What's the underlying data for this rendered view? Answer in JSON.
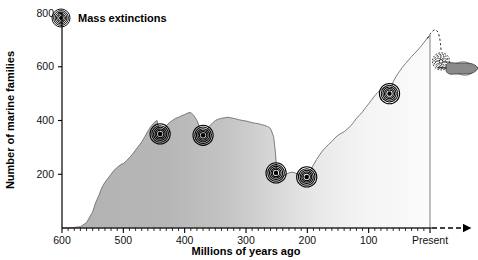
{
  "chart_data": {
    "type": "area",
    "title": "",
    "xlabel": "Millions of years ago",
    "ylabel": "Number of marine families",
    "xlim": [
      600,
      0
    ],
    "ylim": [
      0,
      800
    ],
    "x_ticks": [
      600,
      500,
      400,
      300,
      200,
      100,
      0
    ],
    "x_tick_labels": [
      "600",
      "500",
      "400",
      "300",
      "200",
      "100",
      "Present"
    ],
    "x_minor_tick_step": 10,
    "y_ticks": [
      200,
      400,
      600,
      800
    ],
    "y_tick_labels": [
      "200",
      "400",
      "600",
      "800"
    ],
    "grid": false,
    "legend_position": "top-left",
    "axis_direction_note": "time runs from 600 Mya at left to Present at right",
    "future_arrow": true,
    "series": [
      {
        "name": "Number of marine families",
        "fill": "gradient-gray-to-white",
        "x": [
          600,
          590,
          580,
          570,
          560,
          550,
          545,
          540,
          535,
          530,
          525,
          520,
          515,
          510,
          505,
          500,
          495,
          490,
          485,
          480,
          475,
          470,
          465,
          460,
          455,
          450,
          445,
          440,
          435,
          430,
          425,
          420,
          415,
          410,
          405,
          400,
          395,
          390,
          385,
          380,
          375,
          370,
          365,
          360,
          355,
          350,
          345,
          340,
          335,
          330,
          325,
          320,
          315,
          310,
          305,
          300,
          295,
          290,
          285,
          280,
          275,
          270,
          265,
          260,
          255,
          252,
          250,
          248,
          245,
          240,
          235,
          230,
          225,
          220,
          215,
          210,
          205,
          201,
          198,
          195,
          190,
          185,
          180,
          175,
          170,
          165,
          160,
          155,
          150,
          145,
          140,
          135,
          130,
          125,
          120,
          115,
          110,
          105,
          100,
          95,
          90,
          85,
          80,
          75,
          70,
          66,
          63,
          60,
          55,
          50,
          45,
          40,
          35,
          30,
          25,
          20,
          15,
          10,
          5,
          0
        ],
        "y": [
          0,
          0,
          2,
          5,
          20,
          60,
          95,
          120,
          150,
          170,
          185,
          200,
          215,
          225,
          235,
          240,
          250,
          262,
          275,
          290,
          305,
          320,
          340,
          360,
          378,
          392,
          400,
          350,
          365,
          380,
          392,
          400,
          408,
          412,
          418,
          422,
          428,
          430,
          418,
          400,
          370,
          345,
          360,
          378,
          390,
          400,
          405,
          408,
          410,
          412,
          410,
          408,
          405,
          402,
          400,
          398,
          395,
          392,
          390,
          388,
          385,
          382,
          378,
          370,
          340,
          280,
          215,
          190,
          185,
          192,
          200,
          205,
          208,
          205,
          200,
          195,
          190,
          188,
          200,
          215,
          235,
          255,
          272,
          288,
          300,
          312,
          322,
          335,
          345,
          352,
          358,
          368,
          378,
          392,
          408,
          420,
          432,
          448,
          462,
          478,
          492,
          505,
          515,
          522,
          528,
          500,
          520,
          545,
          565,
          582,
          598,
          612,
          625,
          638,
          650,
          662,
          675,
          690,
          705,
          718
        ]
      }
    ],
    "annotations": [
      {
        "name": "mass-extinction-ordovician",
        "x": 440,
        "y": 350,
        "label": ""
      },
      {
        "name": "mass-extinction-devonian",
        "x": 370,
        "y": 345,
        "label": ""
      },
      {
        "name": "mass-extinction-permian",
        "x": 251,
        "y": 205,
        "label": ""
      },
      {
        "name": "mass-extinction-triassic",
        "x": 201,
        "y": 190,
        "label": ""
      },
      {
        "name": "mass-extinction-cretaceous",
        "x": 66,
        "y": 500,
        "label": ""
      },
      {
        "name": "mass-extinction-sixth-human-caused",
        "x": -18,
        "y": 620,
        "label": "",
        "style": "dashed",
        "has_hand": true
      }
    ]
  },
  "legend": {
    "marker_name": "mass-extinction-marker",
    "label": "Mass extinctions"
  }
}
